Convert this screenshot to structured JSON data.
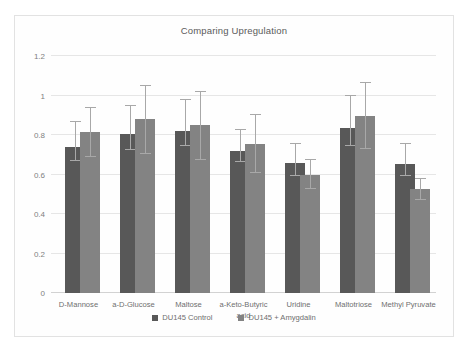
{
  "chart_data": {
    "type": "bar",
    "title": "Comparing Upregulation",
    "xlabel": "",
    "ylabel": "",
    "ylim": [
      0,
      1.2
    ],
    "yticks": [
      "0",
      "0.2",
      "0.4",
      "0.6",
      "0.8",
      "1",
      "1.2"
    ],
    "ytick_values": [
      0,
      0.2,
      0.4,
      0.6,
      0.8,
      1,
      1.2
    ],
    "grid": true,
    "legend_position": "bottom",
    "categories": [
      "D-Mannose",
      "a-D-Glucose",
      "Maltose",
      "a-Keto-Butyric acid",
      "Uridine",
      "Maltotriose",
      "Methyl Pyruvate"
    ],
    "series": [
      {
        "name": "DU145 Control",
        "color": "#585858",
        "values": [
          0.74,
          0.805,
          0.82,
          0.72,
          0.66,
          0.835,
          0.655
        ],
        "errors_low": [
          0.67,
          0.725,
          0.745,
          0.665,
          0.595,
          0.745,
          0.595
        ],
        "errors_high": [
          0.865,
          0.945,
          0.975,
          0.825,
          0.755,
          1.0,
          0.755
        ]
      },
      {
        "name": "DU145 + Amygdalin",
        "color": "#838383",
        "values": [
          0.815,
          0.88,
          0.85,
          0.755,
          0.6,
          0.895,
          0.525
        ],
        "errors_low": [
          0.69,
          0.705,
          0.675,
          0.61,
          0.525,
          0.73,
          0.47
        ],
        "errors_high": [
          0.935,
          1.05,
          1.02,
          0.9,
          0.675,
          1.065,
          0.575
        ]
      }
    ]
  },
  "legend": {
    "items": [
      {
        "label": "DU145 Control",
        "color": "#585858"
      },
      {
        "label": "DU145 + Amygdalin",
        "color": "#838383"
      }
    ]
  }
}
